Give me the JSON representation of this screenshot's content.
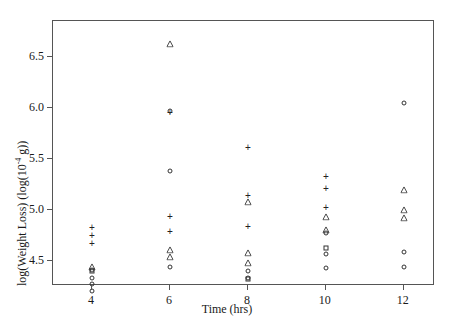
{
  "chart_data": {
    "type": "scatter",
    "title": "",
    "xlabel": "Time (hrs)",
    "ylabel_parts": {
      "prefix": "log(Weight Loss) (log(10",
      "exponent": "-4",
      "suffix": " g))"
    },
    "ylabel": "log(Weight Loss) (log(10^-4 g))",
    "xlim": [
      3.0,
      12.8
    ],
    "ylim": [
      4.25,
      6.85
    ],
    "xticks": [
      4,
      6,
      8,
      10,
      12
    ],
    "xticklabels": [
      "4",
      "6",
      "8",
      "10",
      "12"
    ],
    "yticks": [
      4.5,
      5.0,
      5.5,
      6.0,
      6.5
    ],
    "yticklabels": [
      "4.5",
      "5.0",
      "5.5",
      "6.0",
      "6.5"
    ],
    "grid": false,
    "legend": false,
    "marker_shapes": [
      "circle",
      "plus",
      "triangle",
      "square"
    ],
    "points": [
      {
        "x": 4,
        "y": 4.82,
        "m": "plus"
      },
      {
        "x": 4,
        "y": 4.74,
        "m": "plus"
      },
      {
        "x": 4,
        "y": 4.66,
        "m": "plus"
      },
      {
        "x": 4,
        "y": 4.44,
        "m": "triangle"
      },
      {
        "x": 4,
        "y": 4.41,
        "m": "circle"
      },
      {
        "x": 4,
        "y": 4.4,
        "m": "square"
      },
      {
        "x": 4,
        "y": 4.33,
        "m": "circle"
      },
      {
        "x": 4,
        "y": 4.27,
        "m": "circle"
      },
      {
        "x": 4,
        "y": 4.2,
        "m": "circle"
      },
      {
        "x": 6,
        "y": 6.62,
        "m": "triangle"
      },
      {
        "x": 6,
        "y": 5.97,
        "m": "circle"
      },
      {
        "x": 6,
        "y": 5.95,
        "m": "plus"
      },
      {
        "x": 6,
        "y": 5.38,
        "m": "circle"
      },
      {
        "x": 6,
        "y": 4.93,
        "m": "plus"
      },
      {
        "x": 6,
        "y": 4.78,
        "m": "plus"
      },
      {
        "x": 6,
        "y": 4.6,
        "m": "triangle"
      },
      {
        "x": 6,
        "y": 4.53,
        "m": "triangle"
      },
      {
        "x": 6,
        "y": 4.44,
        "m": "circle"
      },
      {
        "x": 8,
        "y": 5.6,
        "m": "plus"
      },
      {
        "x": 8,
        "y": 5.13,
        "m": "plus"
      },
      {
        "x": 8,
        "y": 5.07,
        "m": "triangle"
      },
      {
        "x": 8,
        "y": 4.83,
        "m": "plus"
      },
      {
        "x": 8,
        "y": 4.57,
        "m": "triangle"
      },
      {
        "x": 8,
        "y": 4.48,
        "m": "triangle"
      },
      {
        "x": 8,
        "y": 4.4,
        "m": "circle"
      },
      {
        "x": 8,
        "y": 4.33,
        "m": "circle"
      },
      {
        "x": 8,
        "y": 4.32,
        "m": "square"
      },
      {
        "x": 10,
        "y": 5.32,
        "m": "plus"
      },
      {
        "x": 10,
        "y": 5.2,
        "m": "plus"
      },
      {
        "x": 10,
        "y": 5.02,
        "m": "plus"
      },
      {
        "x": 10,
        "y": 4.93,
        "m": "triangle"
      },
      {
        "x": 10,
        "y": 4.8,
        "m": "triangle"
      },
      {
        "x": 10,
        "y": 4.77,
        "m": "circle"
      },
      {
        "x": 10,
        "y": 4.62,
        "m": "square"
      },
      {
        "x": 10,
        "y": 4.56,
        "m": "circle"
      },
      {
        "x": 10,
        "y": 4.43,
        "m": "circle"
      },
      {
        "x": 12,
        "y": 6.05,
        "m": "circle"
      },
      {
        "x": 12,
        "y": 5.19,
        "m": "triangle"
      },
      {
        "x": 12,
        "y": 5.0,
        "m": "triangle"
      },
      {
        "x": 12,
        "y": 4.92,
        "m": "triangle"
      },
      {
        "x": 12,
        "y": 4.58,
        "m": "circle"
      },
      {
        "x": 12,
        "y": 4.44,
        "m": "circle"
      }
    ]
  }
}
